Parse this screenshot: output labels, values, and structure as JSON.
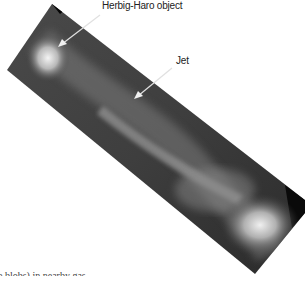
{
  "figure": {
    "annotations": [
      {
        "label": "Herbig-Haro object",
        "arrow_target": "bright knot upper-left"
      },
      {
        "label": "Jet",
        "arrow_target": "jet stream middle"
      }
    ]
  },
  "caption": {
    "partial_text": "e blobs) in nearby gas"
  }
}
